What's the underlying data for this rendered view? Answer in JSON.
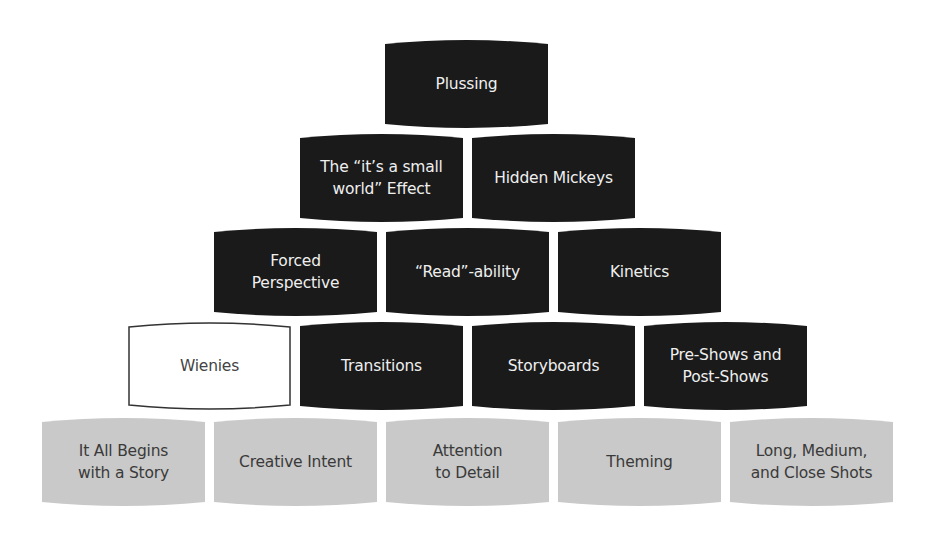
{
  "diagram": {
    "type": "pyramid",
    "colors": {
      "dark_fill": "#1a1a1a",
      "grey_fill": "#c9c9c9",
      "outline_fill": "#ffffff",
      "outline_stroke": "#333333"
    },
    "rows": [
      {
        "level": 1,
        "blocks": [
          {
            "label": "Plussing",
            "style": "dark"
          }
        ]
      },
      {
        "level": 2,
        "blocks": [
          {
            "label": "The “it’s a small\nworld” Effect",
            "style": "dark"
          },
          {
            "label": "Hidden Mickeys",
            "style": "dark"
          }
        ]
      },
      {
        "level": 3,
        "blocks": [
          {
            "label": "Forced\nPerspective",
            "style": "dark"
          },
          {
            "label": "“Read”-ability",
            "style": "dark"
          },
          {
            "label": "Kinetics",
            "style": "dark"
          }
        ]
      },
      {
        "level": 4,
        "blocks": [
          {
            "label": "Wienies",
            "style": "outline"
          },
          {
            "label": "Transitions",
            "style": "dark"
          },
          {
            "label": "Storyboards",
            "style": "dark"
          },
          {
            "label": "Pre-Shows and\nPost-Shows",
            "style": "dark"
          }
        ]
      },
      {
        "level": 5,
        "blocks": [
          {
            "label": "It All Begins\nwith a Story",
            "style": "grey"
          },
          {
            "label": "Creative Intent",
            "style": "grey"
          },
          {
            "label": "Attention\nto Detail",
            "style": "grey"
          },
          {
            "label": "Theming",
            "style": "grey"
          },
          {
            "label": "Long, Medium,\nand Close Shots",
            "style": "grey"
          }
        ]
      }
    ]
  }
}
